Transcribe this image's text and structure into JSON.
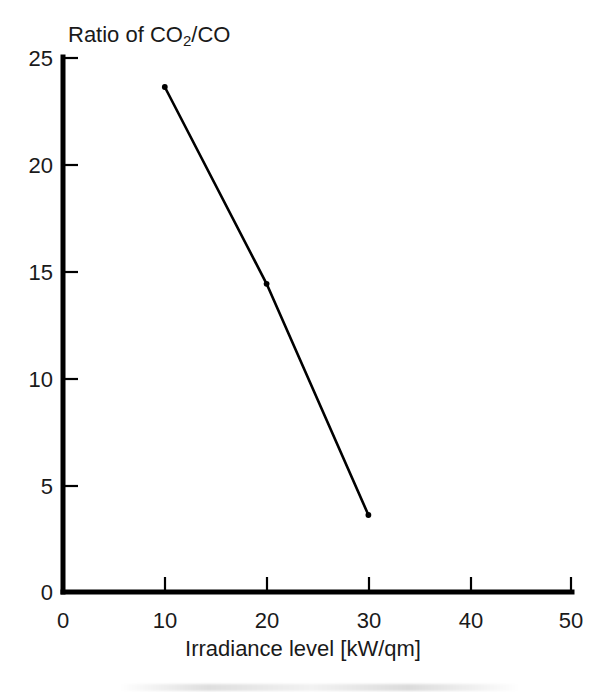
{
  "figure": {
    "title_prefix": "Ratio of CO",
    "title_sub": "2",
    "title_suffix": "/CO",
    "title_plain": "Ratio of CO2/CO",
    "x_axis_title": "Irradiance level [kW/qm]",
    "background_color": "#ffffff",
    "ink_color": "#000000"
  },
  "chart_data": {
    "type": "line",
    "title": "Ratio of CO2/CO",
    "xlabel": "Irradiance level [kW/qm]",
    "ylabel": "Ratio of CO2/CO",
    "xlim": [
      0,
      50
    ],
    "ylim": [
      0,
      25
    ],
    "grid": false,
    "legend": "none",
    "x_ticks": [
      0,
      10,
      20,
      30,
      40,
      50
    ],
    "y_ticks": [
      0,
      5,
      10,
      15,
      20,
      25
    ],
    "x_tick_labels": [
      "0",
      "10",
      "20",
      "30",
      "40",
      "50"
    ],
    "y_tick_labels": [
      "0",
      "5",
      "10",
      "15",
      "20",
      "25"
    ],
    "x": [
      10,
      20,
      30
    ],
    "values": [
      23.6,
      14.4,
      3.6
    ],
    "series": [
      {
        "name": "CO2/CO ratio",
        "color": "#000000",
        "marker": "dot",
        "points": [
          {
            "x": 10,
            "y": 23.6
          },
          {
            "x": 20,
            "y": 14.4
          },
          {
            "x": 30,
            "y": 3.6
          }
        ]
      }
    ]
  }
}
